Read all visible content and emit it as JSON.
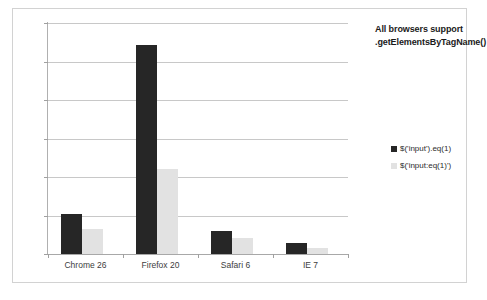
{
  "chart_data": {
    "type": "bar",
    "title": "",
    "categories": [
      "Chrome 26",
      "Firefox 20",
      "Safari 6",
      "IE 7"
    ],
    "series": [
      {
        "name": "$('input').eq(1)",
        "values": [
          5200,
          27200,
          3000,
          1400
        ],
        "color": "#262626"
      },
      {
        "name": "$('input:eq(1)')",
        "values": [
          3250,
          11040,
          2100,
          780
        ],
        "color": "#e2e2e2"
      }
    ],
    "xlabel": "",
    "ylabel": "",
    "ylim": [
      0,
      30000
    ],
    "yticks": [
      0,
      5000,
      10000,
      15000,
      20000,
      25000,
      30000
    ],
    "ytick_labels": [
      "0",
      "5000",
      "10000",
      "15000",
      "20000",
      "25000",
      "30000"
    ],
    "grid": true,
    "legend_position": "right",
    "annotations": [
      {
        "text_line_1": "All browsers support",
        "text_line_2": ".getElementsByTagName()"
      }
    ]
  },
  "annotation": {
    "line1": "All browsers support",
    "line2": ".getElementsByTagName()"
  },
  "legend": {
    "items": [
      {
        "label": "$('input').eq(1)"
      },
      {
        "label": "$('input:eq(1)')"
      }
    ]
  }
}
